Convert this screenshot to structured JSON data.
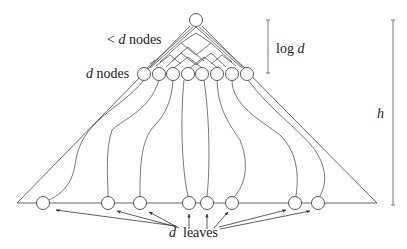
{
  "diagram": {
    "labels": {
      "top_level": {
        "prefix": "< ",
        "var": "d",
        "suffix": " nodes"
      },
      "d_nodes": {
        "var": "d",
        "suffix": " nodes"
      },
      "log_d": {
        "prefix": "log ",
        "var": "d"
      },
      "height": {
        "var": "h"
      },
      "leaves": {
        "var": "d",
        "suffix": "leaves"
      }
    },
    "root": {
      "x": 196,
      "y": 20,
      "r": 6.5
    },
    "triangle": {
      "apex": [
        196,
        22
      ],
      "base_left": [
        17,
        203
      ],
      "base_right": [
        377,
        203
      ]
    },
    "d_nodes": {
      "y": 74,
      "r": 6.5,
      "xs": [
        144,
        159,
        173,
        188,
        202,
        217,
        232,
        247
      ]
    },
    "leaves": {
      "y": 203,
      "r": 6.5,
      "xs": [
        43,
        108,
        140,
        189,
        207,
        232,
        295,
        318
      ]
    },
    "brackets": {
      "log_d": {
        "x": 268,
        "y1": 20,
        "y2": 73
      },
      "h": {
        "x": 393,
        "y1": 20,
        "y2": 205
      }
    },
    "colors": {
      "stroke": "#444444",
      "background": "#ffffff"
    }
  }
}
